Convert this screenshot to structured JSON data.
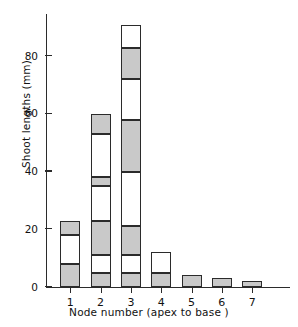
{
  "chart_data": {
    "type": "bar",
    "title": "",
    "subtitle": "",
    "xlabel": "Node number (apex to base )",
    "ylabel": "Shoot lengths (mm)",
    "categories": [
      "1",
      "2",
      "3",
      "4",
      "5",
      "6",
      "7"
    ],
    "values": [
      23,
      60,
      91,
      12,
      4,
      3,
      2
    ],
    "ylim": [
      0,
      95
    ],
    "yticks": [
      0,
      20,
      40,
      60,
      80
    ],
    "ytick_labels": [
      "0",
      "20",
      "40",
      "60",
      "80"
    ],
    "grid": false,
    "legend": "none",
    "note": "Stacked bar: each bar subdivided into alternating shaded and open segments representing individual shoots",
    "stacks": [
      {
        "category": "1",
        "total": 23,
        "segments": [
          {
            "from": 0,
            "to": 8,
            "style": "filled"
          },
          {
            "from": 8,
            "to": 18,
            "style": "open"
          },
          {
            "from": 18,
            "to": 23,
            "style": "filled"
          }
        ]
      },
      {
        "category": "2",
        "total": 60,
        "segments": [
          {
            "from": 0,
            "to": 5,
            "style": "filled"
          },
          {
            "from": 5,
            "to": 11,
            "style": "open"
          },
          {
            "from": 11,
            "to": 23,
            "style": "filled"
          },
          {
            "from": 23,
            "to": 35,
            "style": "open"
          },
          {
            "from": 35,
            "to": 38,
            "style": "filled"
          },
          {
            "from": 38,
            "to": 53,
            "style": "open"
          },
          {
            "from": 53,
            "to": 60,
            "style": "filled"
          }
        ]
      },
      {
        "category": "3",
        "total": 91,
        "segments": [
          {
            "from": 0,
            "to": 5,
            "style": "filled"
          },
          {
            "from": 5,
            "to": 11,
            "style": "open"
          },
          {
            "from": 11,
            "to": 21,
            "style": "filled"
          },
          {
            "from": 21,
            "to": 40,
            "style": "open"
          },
          {
            "from": 40,
            "to": 58,
            "style": "filled"
          },
          {
            "from": 58,
            "to": 72,
            "style": "open"
          },
          {
            "from": 72,
            "to": 83,
            "style": "filled"
          },
          {
            "from": 83,
            "to": 91,
            "style": "open"
          }
        ]
      },
      {
        "category": "4",
        "total": 12,
        "segments": [
          {
            "from": 0,
            "to": 5,
            "style": "filled"
          },
          {
            "from": 5,
            "to": 12,
            "style": "open"
          }
        ]
      },
      {
        "category": "5",
        "total": 4,
        "segments": [
          {
            "from": 0,
            "to": 4,
            "style": "filled"
          }
        ]
      },
      {
        "category": "6",
        "total": 3,
        "segments": [
          {
            "from": 0,
            "to": 3,
            "style": "filled"
          }
        ]
      },
      {
        "category": "7",
        "total": 2,
        "segments": [
          {
            "from": 0,
            "to": 2,
            "style": "filled"
          }
        ]
      }
    ],
    "colors": {
      "filled": "#c9c9c9",
      "open": "#ffffff",
      "outline": "#2b2b2b",
      "axis": "#2b2b2b",
      "text": "#111111"
    }
  }
}
